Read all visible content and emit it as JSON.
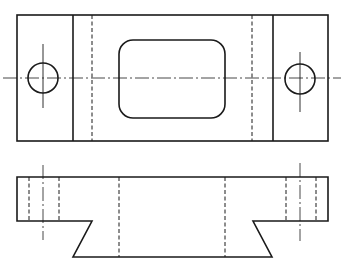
{
  "drawing": {
    "title": "",
    "type": "orthographic engineering drawing",
    "views": [
      {
        "name": "top-view",
        "outline": {
          "x1": 17,
          "y1": 15,
          "x2": 328,
          "y2": 141
        },
        "inner_verticals": [
          73,
          273
        ],
        "hidden_verticals": [
          92,
          252
        ],
        "slot": {
          "x1": 119,
          "y1": 40,
          "x2": 225,
          "y2": 118,
          "radius": 14
        },
        "holes": [
          {
            "cx": 43,
            "cy": 78,
            "r": 15
          },
          {
            "cx": 300,
            "cy": 79,
            "r": 15
          }
        ],
        "centerline_y": 78
      },
      {
        "name": "front-view",
        "top_y": 177,
        "step_y": 221,
        "bottom_y": 257,
        "left_x": 17,
        "right_x": 328,
        "dovetail": {
          "left_top": 92,
          "left_bottom": 73,
          "right_top": 253,
          "right_bottom": 272
        },
        "hole_hidden_lines": [
          29,
          59,
          286,
          316
        ],
        "hole_centers": [
          43,
          300
        ],
        "slot_hidden_lines": [
          119,
          225
        ]
      }
    ],
    "line_color": "#1a1a1a",
    "background": "#ffffff"
  }
}
